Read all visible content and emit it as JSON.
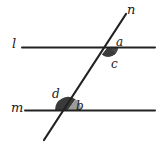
{
  "figure": {
    "type": "geometry-diagram",
    "width": 160,
    "height": 148,
    "background_color": "#ffffff",
    "stroke_color": "#222222",
    "line_width": 2,
    "lines": [
      {
        "id": "line-l",
        "label": "l",
        "kind": "horizontal",
        "x1": 22,
        "y1": 47,
        "x2": 155,
        "y2": 47,
        "label_x": 12,
        "label_y": 37
      },
      {
        "id": "line-m",
        "label": "m",
        "kind": "horizontal",
        "x1": 25,
        "y1": 110,
        "x2": 155,
        "y2": 110,
        "label_x": 11,
        "label_y": 101
      },
      {
        "id": "line-n",
        "label": "n",
        "kind": "transversal",
        "x1": 44,
        "y1": 140,
        "x2": 126,
        "y2": 14,
        "label_x": 127,
        "label_y": 3
      }
    ],
    "intersections": [
      {
        "id": "intersection-upper",
        "lines": [
          "l",
          "n"
        ],
        "x": 108,
        "y": 47
      },
      {
        "id": "intersection-lower",
        "lines": [
          "m",
          "n"
        ],
        "x": 68,
        "y": 110
      }
    ],
    "angles": [
      {
        "id": "angle-a",
        "label": "a",
        "at": "intersection-upper",
        "position": "upper-right",
        "marker": "none",
        "label_x": 116,
        "label_y": 36
      },
      {
        "id": "angle-c",
        "label": "c",
        "at": "intersection-upper",
        "position": "lower-right",
        "marker": "filled-sector",
        "marker_color": "#4a4a4a",
        "label_x": 111,
        "label_y": 58
      },
      {
        "id": "angle-d",
        "label": "d",
        "at": "intersection-lower",
        "position": "upper-left",
        "marker": "filled-sector",
        "marker_color": "#3a3a3a",
        "label_x": 52,
        "label_y": 88
      },
      {
        "id": "angle-b",
        "label": "b",
        "at": "intersection-lower",
        "position": "upper-right",
        "marker": "filled-sector",
        "marker_color": "#9a9a9a",
        "label_x": 76,
        "label_y": 100
      }
    ],
    "colors": {
      "stroke": "#222222",
      "arc_dark": "#3a3a3a",
      "arc_mid": "#4a4a4a",
      "arc_light": "#9a9a9a",
      "text": "#1a1a1a",
      "background": "#ffffff"
    }
  }
}
